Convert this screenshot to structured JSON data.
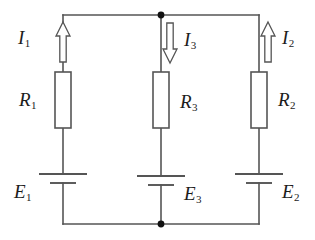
{
  "diagram": {
    "type": "electrical-circuit-schematic",
    "line_color": "#555555",
    "label_color": "#1c1c1c",
    "background": "#ffffff",
    "junction_color": "#111111",
    "branches": [
      {
        "id": "left",
        "current": {
          "label": "I",
          "subscript": "1",
          "direction": "up",
          "arrow_glyph": "hollow-arrow-up"
        },
        "resistor": {
          "label": "R",
          "subscript": "1",
          "label_side": "left"
        },
        "source": {
          "label": "E",
          "subscript": "1",
          "label_side": "left",
          "symbol": "battery-cell"
        }
      },
      {
        "id": "middle",
        "current": {
          "label": "I",
          "subscript": "3",
          "direction": "down",
          "arrow_glyph": "hollow-arrow-down"
        },
        "resistor": {
          "label": "R",
          "subscript": "3",
          "label_side": "right"
        },
        "source": {
          "label": "E",
          "subscript": "3",
          "label_side": "right",
          "symbol": "battery-cell"
        }
      },
      {
        "id": "right",
        "current": {
          "label": "I",
          "subscript": "2",
          "direction": "up",
          "arrow_glyph": "hollow-arrow-up"
        },
        "resistor": {
          "label": "R",
          "subscript": "2",
          "label_side": "right"
        },
        "source": {
          "label": "E",
          "subscript": "2",
          "label_side": "right",
          "symbol": "battery-cell"
        }
      }
    ],
    "junctions": [
      {
        "id": "top-node",
        "x": 161,
        "y": 15
      },
      {
        "id": "bottom-node",
        "x": 161,
        "y": 224
      }
    ],
    "labels": {
      "i1": "I",
      "i1_sub": "1",
      "i2": "I",
      "i2_sub": "2",
      "i3": "I",
      "i3_sub": "3",
      "r1": "R",
      "r1_sub": "1",
      "r2": "R",
      "r2_sub": "2",
      "r3": "R",
      "r3_sub": "3",
      "e1": "E",
      "e1_sub": "1",
      "e2": "E",
      "e2_sub": "2",
      "e3": "E",
      "e3_sub": "3"
    }
  }
}
